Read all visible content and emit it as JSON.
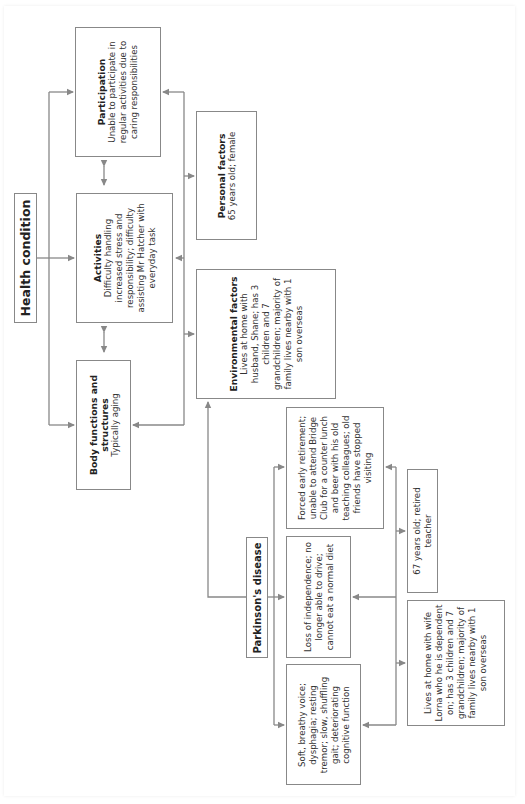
{
  "diagram": {
    "type": "ICF framework concept map (rotated 90° counter-clockwise)",
    "colors": {
      "line": "#888888",
      "text": "#333333",
      "border": "#888888"
    },
    "nodes": {
      "health_condition": {
        "title": "Health condition",
        "text": ""
      },
      "participation": {
        "title": "Participation",
        "text": "Unable to participate in regular activities due to caring responsibilities"
      },
      "activities": {
        "title": "Activities",
        "text": "Difficulty handling increased stress and responsibility; difficulty assisting Mr Hatcher with everyday task"
      },
      "body_functions": {
        "title": "Body functions and structures",
        "text": "Typically aging"
      },
      "personal_factors": {
        "title": "Personal factors",
        "text": "65 years old; female"
      },
      "environmental_factors": {
        "title": "Environmental factors",
        "text": "Lives at home with husband, Shane; has 3 children and 7 grandchildren; majority of family lives nearby with 1 son overseas"
      },
      "parkinsons": {
        "title": "Parkinson's disease",
        "text": ""
      },
      "pd_body": {
        "title": "",
        "text": "Soft, breathy voice; dysphagia; resting tremor; slow, shuffling gait; deteriorating cognitive function"
      },
      "pd_activities": {
        "title": "",
        "text": "Loss of independence; no longer able to drive; cannot eat a normal diet"
      },
      "pd_participation": {
        "title": "",
        "text": "Forced early retirement; unable to attend Bridge Club for a counter lunch and beer with his old teaching colleagues; old friends have stopped visiting"
      },
      "pd_personal": {
        "title": "",
        "text": "67 years old; retired teacher"
      },
      "pd_environmental": {
        "title": "",
        "text": "Lives at home with wife Lorna who he is dependent on; has 3 children and 7 grandchildren; majority of family lives nearby with 1 son overseas"
      }
    },
    "edges": [
      {
        "from": "health_condition",
        "to": "participation"
      },
      {
        "from": "health_condition",
        "to": "activities"
      },
      {
        "from": "health_condition",
        "to": "body_functions"
      },
      {
        "from": "participation",
        "to": "activities",
        "bidirectional": true
      },
      {
        "from": "activities",
        "to": "body_functions",
        "bidirectional": true
      },
      {
        "from": "contextual_bus",
        "to": "participation"
      },
      {
        "from": "contextual_bus",
        "to": "activities"
      },
      {
        "from": "contextual_bus",
        "to": "body_functions"
      },
      {
        "from": "contextual_bus",
        "to": "personal_factors"
      },
      {
        "from": "contextual_bus",
        "to": "environmental_factors"
      },
      {
        "from": "parkinsons",
        "to": "environmental_factors"
      },
      {
        "from": "parkinsons",
        "to": "pd_body"
      },
      {
        "from": "parkinsons",
        "to": "pd_activities"
      },
      {
        "from": "parkinsons",
        "to": "pd_participation"
      },
      {
        "from": "pd_contextual_bus",
        "to": "pd_body"
      },
      {
        "from": "pd_contextual_bus",
        "to": "pd_activities"
      },
      {
        "from": "pd_contextual_bus",
        "to": "pd_participation"
      },
      {
        "from": "pd_contextual_bus",
        "to": "pd_personal"
      },
      {
        "from": "pd_contextual_bus",
        "to": "pd_environmental"
      }
    ]
  }
}
